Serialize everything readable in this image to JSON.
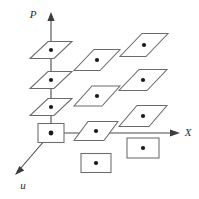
{
  "figure": {
    "width": 199,
    "height": 199,
    "background": "#ffffff",
    "stroke_color": "#6b6b6b",
    "axis_color": "#4a4a4a",
    "dot_color": "#1a1a1a"
  },
  "axes": [
    {
      "id": "p-axis",
      "label": "P",
      "label_x": 33,
      "label_y": 18,
      "x1": 51,
      "y1": 133,
      "x2": 51,
      "y2": 14,
      "arrow": "up"
    },
    {
      "id": "x-axis",
      "label": "X",
      "label_x": 186,
      "label_y": 136,
      "x1": 51,
      "y1": 133,
      "x2": 178,
      "y2": 133,
      "arrow": "right"
    },
    {
      "id": "u-axis",
      "label": "u",
      "label_x": 22,
      "label_y": 188,
      "x1": 51,
      "y1": 133,
      "x2": 15,
      "y2": 175,
      "arrow": "down-left"
    }
  ],
  "cells": [
    {
      "name": "cell-origin-box",
      "type": "rectangle",
      "cx": 51,
      "cy": 133,
      "w": 26,
      "h": 19,
      "dot": false
    },
    {
      "name": "cell-p-col-low",
      "type": "parallelogram",
      "cx": 51,
      "cy": 107,
      "w": 24,
      "h": 17,
      "skew": 9,
      "dot": true
    },
    {
      "name": "cell-p-col-mid",
      "type": "parallelogram",
      "cx": 51,
      "cy": 80,
      "w": 24,
      "h": 17,
      "skew": 9,
      "dot": true
    },
    {
      "name": "cell-p-col-high",
      "type": "parallelogram",
      "cx": 51,
      "cy": 50,
      "w": 24,
      "h": 17,
      "skew": 9,
      "dot": true
    },
    {
      "name": "cell-mid-col-axis",
      "type": "parallelogram",
      "cx": 96,
      "cy": 131,
      "w": 30,
      "h": 19,
      "skew": 7,
      "dot": true
    },
    {
      "name": "cell-mid-col-mid",
      "type": "parallelogram",
      "cx": 97,
      "cy": 96,
      "w": 28,
      "h": 20,
      "skew": 9,
      "dot": true
    },
    {
      "name": "cell-mid-col-high",
      "type": "parallelogram",
      "cx": 97,
      "cy": 60,
      "w": 26,
      "h": 21,
      "skew": 10,
      "dot": true
    },
    {
      "name": "cell-mid-col-below",
      "type": "rectangle",
      "cx": 96,
      "cy": 163,
      "w": 30,
      "h": 19,
      "dot": true
    },
    {
      "name": "cell-right-col-below",
      "type": "rectangle",
      "cx": 143,
      "cy": 148,
      "w": 32,
      "h": 20,
      "dot": true
    },
    {
      "name": "cell-right-col-axis",
      "type": "parallelogram",
      "cx": 143,
      "cy": 116,
      "w": 30,
      "h": 21,
      "skew": 9,
      "dot": true
    },
    {
      "name": "cell-right-col-mid",
      "type": "parallelogram",
      "cx": 143,
      "cy": 80,
      "w": 28,
      "h": 21,
      "skew": 10,
      "dot": true
    },
    {
      "name": "cell-right-col-high",
      "type": "parallelogram",
      "cx": 144,
      "cy": 45,
      "w": 26,
      "h": 23,
      "skew": 11,
      "dot": true
    }
  ]
}
